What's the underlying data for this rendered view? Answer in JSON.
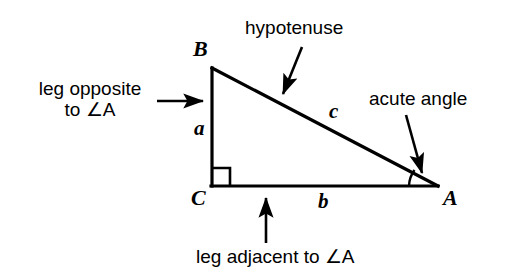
{
  "figure": {
    "kind": "right-triangle-labeled-diagram",
    "background_color": "#ffffff",
    "stroke_color": "#000000"
  },
  "vertices": {
    "b": "B",
    "c": "C",
    "a": "A"
  },
  "sides": {
    "a": "a",
    "b": "b",
    "c": "c"
  },
  "annotations": {
    "leg_opposite_line1": "leg opposite",
    "leg_opposite_line2": "to ∠A",
    "hypotenuse": "hypotenuse",
    "acute_angle": "acute angle",
    "leg_adjacent": "leg adjacent to ∠A"
  },
  "markers": {
    "right_angle": "right-angle-square",
    "acute_angle_arc": "angle-arc"
  }
}
